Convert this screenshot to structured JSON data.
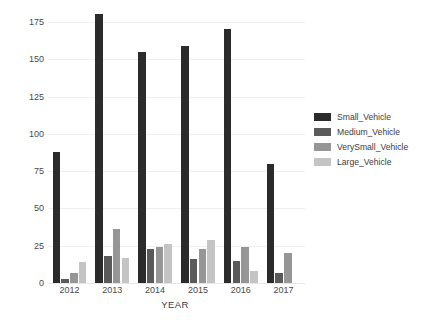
{
  "chart_data": {
    "type": "bar",
    "title": "",
    "xlabel": "YEAR",
    "ylabel": "NUMBER OF PERSONS KILLED",
    "categories": [
      "2012",
      "2013",
      "2014",
      "2015",
      "2016",
      "2017"
    ],
    "ylim": [
      0,
      183
    ],
    "yticks": [
      0,
      25,
      50,
      75,
      100,
      125,
      150,
      175
    ],
    "grid": "horizontal",
    "legend_position": "right",
    "series": [
      {
        "name": "Small_Vehicle",
        "color": "#2b2b2b",
        "values": [
          88,
          180,
          155,
          159,
          170,
          80
        ]
      },
      {
        "name": "Medium_Vehicle",
        "color": "#5a5a5a",
        "values": [
          3,
          18,
          23,
          16,
          15,
          7
        ]
      },
      {
        "name": "VerySmall_Vehicle",
        "color": "#969696",
        "values": [
          7,
          36,
          24,
          23,
          24,
          20
        ]
      },
      {
        "name": "Large_Vehicle",
        "color": "#c4c4c4",
        "values": [
          14,
          17,
          26,
          29,
          8,
          0
        ]
      }
    ]
  },
  "legend": {
    "items": [
      {
        "label": "Small_Vehicle"
      },
      {
        "label": "Medium_Vehicle"
      },
      {
        "label": "VerySmall_Vehicle"
      },
      {
        "label": "Large_Vehicle"
      }
    ]
  }
}
